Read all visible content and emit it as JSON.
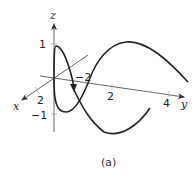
{
  "figure": {
    "caption": "(a)",
    "axes": {
      "x": {
        "label": "x",
        "ticks": [
          {
            "value": 2,
            "label": "2"
          }
        ]
      },
      "y": {
        "label": "y",
        "ticks": [
          {
            "value": -2,
            "label": "−2"
          },
          {
            "value": 2,
            "label": "2"
          },
          {
            "value": 4,
            "label": "4"
          }
        ]
      },
      "z": {
        "label": "z",
        "ticks": [
          {
            "value": 1,
            "label": "1"
          },
          {
            "value": -1,
            "label": "−1"
          }
        ]
      }
    },
    "curve": {
      "description": "3D space curve with direction arrow",
      "color": "#222222"
    }
  }
}
